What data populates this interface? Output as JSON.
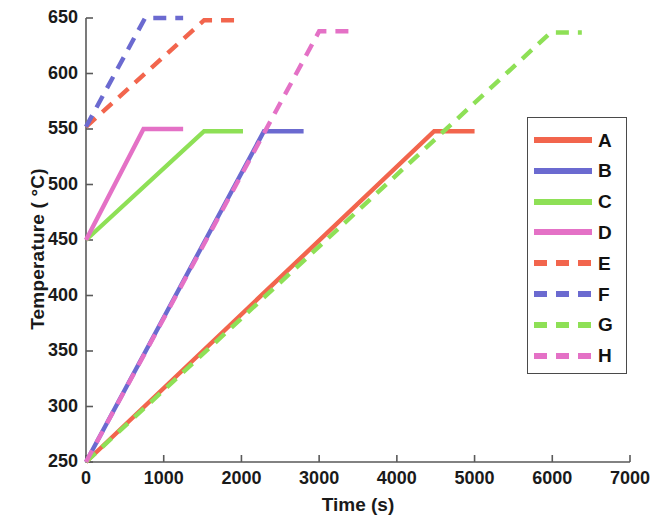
{
  "chart_data": {
    "type": "line",
    "title": "",
    "xlabel": "Time (s)",
    "ylabel": "Temperature ( °C)",
    "xlim": [
      0,
      7000
    ],
    "ylim": [
      250,
      650
    ],
    "xticks": [
      0,
      1000,
      2000,
      3000,
      4000,
      5000,
      6000,
      7000
    ],
    "yticks": [
      250,
      300,
      350,
      400,
      450,
      500,
      550,
      600,
      650
    ],
    "xtick_labels": [
      "0",
      "1000",
      "2000",
      "3000",
      "4000",
      "5000",
      "6000",
      "7000"
    ],
    "ytick_labels": [
      "250",
      "300",
      "350",
      "400",
      "450",
      "500",
      "550",
      "600",
      "650"
    ],
    "grid": false,
    "legend_position": "right",
    "series": [
      {
        "name": "A",
        "color": "#f2654d",
        "style": "solid",
        "x": [
          0,
          4480,
          5000
        ],
        "y": [
          250,
          548,
          548
        ],
        "description": "slow ramp from 250 to 548 C then hold"
      },
      {
        "name": "B",
        "color": "#6b6ad0",
        "style": "solid",
        "x": [
          0,
          2290,
          2800
        ],
        "y": [
          250,
          548,
          548
        ],
        "description": "ramp from 250 to 548 C then hold"
      },
      {
        "name": "C",
        "color": "#8ee056",
        "style": "solid",
        "x": [
          0,
          1520,
          2020
        ],
        "y": [
          450,
          548,
          548
        ],
        "description": "ramp from 450 to 548 C then hold"
      },
      {
        "name": "D",
        "color": "#e471c6",
        "style": "solid",
        "x": [
          0,
          740,
          1250
        ],
        "y": [
          450,
          550,
          550
        ],
        "description": "fast ramp from 450 to 550 C then hold"
      },
      {
        "name": "E",
        "color": "#f2654d",
        "style": "dashed",
        "x": [
          0,
          1520,
          2000
        ],
        "y": [
          552,
          648,
          648
        ],
        "description": "ramp from 552 to 648 C then hold"
      },
      {
        "name": "F",
        "color": "#6b6ad0",
        "style": "dashed",
        "x": [
          0,
          760,
          1250
        ],
        "y": [
          552,
          650,
          650
        ],
        "description": "fast ramp from 552 to 650 C then hold"
      },
      {
        "name": "G",
        "color": "#8ee056",
        "style": "dashed",
        "x": [
          0,
          5980,
          6380
        ],
        "y": [
          250,
          637,
          637
        ],
        "description": "slow ramp from 250 to 637 C then hold"
      },
      {
        "name": "H",
        "color": "#e471c6",
        "style": "dashed",
        "x": [
          0,
          3000,
          3470
        ],
        "y": [
          250,
          638,
          638
        ],
        "description": "ramp from 250 to 638 C then hold"
      }
    ]
  },
  "legend": {
    "entries": [
      {
        "label": "A",
        "color": "#f2654d",
        "style": "solid"
      },
      {
        "label": "B",
        "color": "#6b6ad0",
        "style": "solid"
      },
      {
        "label": "C",
        "color": "#8ee056",
        "style": "solid"
      },
      {
        "label": "D",
        "color": "#e471c6",
        "style": "solid"
      },
      {
        "label": "E",
        "color": "#f2654d",
        "style": "dashed"
      },
      {
        "label": "F",
        "color": "#6b6ad0",
        "style": "dashed"
      },
      {
        "label": "G",
        "color": "#8ee056",
        "style": "dashed"
      },
      {
        "label": "H",
        "color": "#e471c6",
        "style": "dashed"
      }
    ]
  },
  "axis_style": {
    "frame_color": "#5a5a5a",
    "text_color": "#1a1a1a"
  }
}
